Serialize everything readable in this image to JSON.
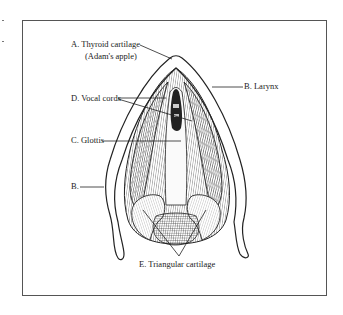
{
  "figure": {
    "type": "anatomical-illustration",
    "labels": {
      "a_title": "A. Thyroid cartilage",
      "a_subtitle": "(Adam's apple)",
      "b_larynx": "B. Larynx",
      "d_vocal_cords": "D. Vocal cords",
      "c_glottis": "C. Glottis",
      "b_short": "B.",
      "e_triangular": "E. Triangular cartilage"
    },
    "colors": {
      "line": "#222222",
      "frame": "#555555",
      "background": "#ffffff"
    }
  }
}
